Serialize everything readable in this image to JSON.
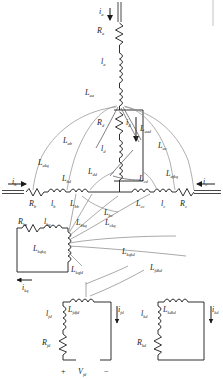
{
  "figure": {
    "type": "electrical-schematic",
    "colors": {
      "wire": "#1a1a1a",
      "leader": "#6d6d6d",
      "leader_light": "#9a9a9a",
      "text": "#1a1a1a",
      "background": "#ffffff"
    }
  },
  "labels": {
    "i_a": "i",
    "i_a_sub": "a",
    "R_a": "R",
    "R_a_sub": "a",
    "l_a": "l",
    "l_a_sub": "a",
    "L_aa": "L",
    "L_aa_sub": "aa",
    "R_d": "R",
    "R_d_sub": "d",
    "i_d": "i",
    "i_d_sub": "d",
    "L_aad": "L",
    "L_aad_sub": "aad",
    "l_d": "l",
    "l_d_sub": "d",
    "L_dd": "L",
    "L_dd_sub": "dd",
    "L_ab": "L",
    "L_ab_sub": "ab",
    "L_akq": "L",
    "L_akq_sub": "akq",
    "L_bd": "L",
    "L_bd_sub": "bd",
    "L_cd": "L",
    "L_cd_sub": "cd",
    "L_ac": "L",
    "L_ac_sub": "ac",
    "L_afkq": "L",
    "L_afkq_sub": "afkq",
    "i_b": "i",
    "i_b_sub": "b",
    "R_b": "R",
    "R_b_sub": "b",
    "l_b": "l",
    "l_b_sub": "b",
    "L_bb": "L",
    "L_bb_sub": "bb",
    "L_bc": "L",
    "L_bc_sub": "bc",
    "L_cc": "L",
    "L_cc_sub": "cc",
    "l_c": "l",
    "l_c_sub": "c",
    "R_c": "R",
    "R_c_sub": "c",
    "i_c": "i",
    "i_c_sub": "c",
    "R_kq": "R",
    "R_kq_sub": "kq",
    "l_kq": "l",
    "l_kq_sub": "kq",
    "L_kqkq": "L",
    "L_kqkq_sub": "kqkq",
    "i_kq": "i",
    "i_kq_sub": "kq",
    "L_bkq": "L",
    "L_bkq_sub": "bkq",
    "L_ckq": "L",
    "L_ckq_sub": "ckq",
    "L_kqfd": "L",
    "L_kqfd_sub": "kqfd",
    "L_kqkd": "L",
    "L_kqkd_sub": "kqkd",
    "L_fdkd": "L",
    "L_fdkd_sub": "fdkd",
    "l_fd": "l",
    "l_fd_sub": "fd",
    "R_fd": "R",
    "R_fd_sub": "fd",
    "L_fdfd": "L",
    "L_fdfd_sub": "fdfd",
    "i_fd": "i",
    "i_fd_sub": "fd",
    "V_fd": "V",
    "V_fd_sub": "fd",
    "plus": "+",
    "minus": "−",
    "l_kd": "l",
    "l_kd_sub": "kd",
    "R_kd": "R",
    "R_kd_sub": "kd",
    "L_kdkd": "L",
    "L_kdkd_sub": "kdkd",
    "i_kd": "i",
    "i_kd_sub": "kd"
  },
  "nodes": {
    "phase_a_branch": "Phase A series branch with resistance and leakage inductance",
    "d_axis_branch": "Direct axis magnetizing branch",
    "phase_b_branch": "Phase B series branch",
    "phase_c_branch": "Phase C series branch",
    "kq_loop": "q-axis damper winding loop",
    "fd_loop": "Field winding loop with source",
    "kd_loop": "d-axis damper winding loop"
  }
}
